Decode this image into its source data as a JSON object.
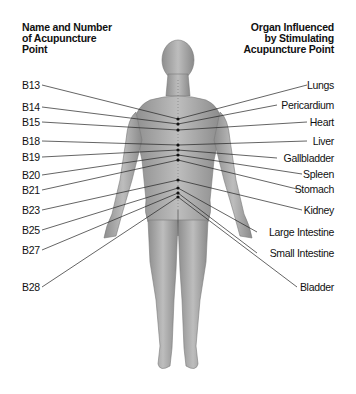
{
  "headings": {
    "left": [
      "Name and Number",
      "of Acupuncture",
      "Point"
    ],
    "right": [
      "Organ Influenced",
      "by Stimulating",
      "Acupuncture Point"
    ]
  },
  "points": [
    {
      "name": "B13",
      "label_y": 85,
      "point_y": 119
    },
    {
      "name": "B14",
      "label_y": 107,
      "point_y": 124
    },
    {
      "name": "B15",
      "label_y": 122,
      "point_y": 130
    },
    {
      "name": "B18",
      "label_y": 141,
      "point_y": 145
    },
    {
      "name": "B19",
      "label_y": 157,
      "point_y": 150
    },
    {
      "name": "B20",
      "label_y": 175,
      "point_y": 155
    },
    {
      "name": "B21",
      "label_y": 190,
      "point_y": 160
    },
    {
      "name": "B23",
      "label_y": 210,
      "point_y": 180
    },
    {
      "name": "B25",
      "label_y": 230,
      "point_y": 188
    },
    {
      "name": "B27",
      "label_y": 250,
      "point_y": 193
    },
    {
      "name": "B28",
      "label_y": 287,
      "point_y": 197
    }
  ],
  "organs": [
    {
      "name": "Lungs",
      "label_y": 85,
      "point_y": 119
    },
    {
      "name": "Pericardium",
      "label_y": 105,
      "point_y": 124
    },
    {
      "name": "Heart",
      "label_y": 122,
      "point_y": 130
    },
    {
      "name": "Liver",
      "label_y": 141,
      "point_y": 145
    },
    {
      "name": "Gallbladder",
      "label_y": 158,
      "point_y": 150
    },
    {
      "name": "Spleen",
      "label_y": 174,
      "point_y": 155
    },
    {
      "name": "Stomach",
      "label_y": 189,
      "point_y": 160
    },
    {
      "name": "Kidney",
      "label_y": 210,
      "point_y": 180
    },
    {
      "name": "Large Intestine",
      "label_y": 232,
      "point_y": 188
    },
    {
      "name": "Small Intestine",
      "label_y": 253,
      "point_y": 193
    },
    {
      "name": "Bladder",
      "label_y": 287,
      "point_y": 197
    }
  ],
  "colors": {
    "skin_light": "#bdbdbd",
    "skin_mid": "#9a9a9a",
    "skin_dark": "#6e6e6e",
    "leader_line": "#222222",
    "point_dot": "#111111"
  }
}
